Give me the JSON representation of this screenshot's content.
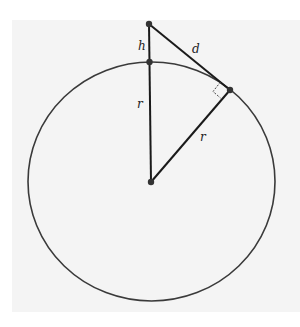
{
  "diagram": {
    "title": "",
    "colors": {
      "stroke": "#1a1a1a",
      "circle": "#3a3a3a",
      "background_panel": "#f4f4f4",
      "label": "#222222"
    },
    "circle": {
      "cx": 151.5,
      "cy": 181.5,
      "rx": 123.5,
      "ry": 119.5
    },
    "points": {
      "observer": {
        "x": 149,
        "y": 24
      },
      "surface_top": {
        "x": 149,
        "y": 62
      },
      "center": {
        "x": 151,
        "y": 182
      },
      "tangent": {
        "x": 230,
        "y": 90
      }
    },
    "labels": {
      "h": "h",
      "d": "d",
      "r_vertical": "r",
      "r_diagonal": "r"
    }
  }
}
